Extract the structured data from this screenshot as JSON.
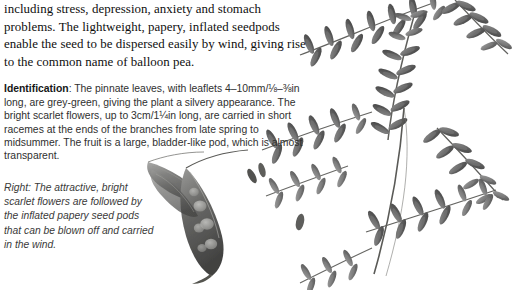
{
  "page": {
    "width": 520,
    "height": 290,
    "background_color": "#ffffff",
    "text_color": "#161616",
    "ink_color": "#4a4a4a"
  },
  "body_paragraph": {
    "text": "including stress, depression, anxiety and stomach problems. The lightweight, papery, inflated seedpods enable the seed to be dispersed easily by wind, giving rise to the common name of balloon pea."
  },
  "identification": {
    "label": "Identification",
    "separator": ":",
    "text": " The pinnate leaves, with leaflets 4–10mm/⅛–⅜in long, are grey-green, giving the plant a silvery appearance. The bright scarlet flowers, up to 3cm/1¼in long, are carried in short racemes at the ends of the branches from late spring to midsummer. The fruit is a large, bladder-like pod, which is almost transparent."
  },
  "caption": {
    "text": "Right: The attractive, bright scarlet flowers are followed by the inflated papery seed pods that can be blown off and carried in the wind."
  },
  "illustration": {
    "name": "balloon-pea-plant-illustration",
    "description": "Grayscale botanical photograph of pinnate leaves, flower buds and inflated translucent seedpods",
    "ink_dark": "#434343",
    "ink_mid": "#6d6d6d",
    "ink_light": "#9a9a9a",
    "stem_color": "#5a5a57"
  }
}
